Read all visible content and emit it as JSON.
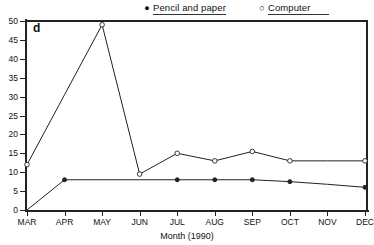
{
  "panel": {
    "label": "d"
  },
  "legend": {
    "position": "top",
    "items": [
      {
        "marker": "filled-dot-icon",
        "glyph": "●",
        "label": "Pencil and paper"
      },
      {
        "marker": "open-circle-icon",
        "glyph": "○",
        "label": "Computer"
      }
    ]
  },
  "chart_data": {
    "type": "line",
    "title": "",
    "subtitle": "",
    "panel_label": "d",
    "xlabel": "Month (1990)",
    "ylabel": "",
    "categories": [
      "MAR",
      "APR",
      "MAY",
      "JUN",
      "JUL",
      "AUG",
      "SEP",
      "OCT",
      "NOV",
      "DEC"
    ],
    "x": [
      "MAR",
      "APR",
      "MAY",
      "JUN",
      "JUL",
      "AUG",
      "SEP",
      "OCT",
      "NOV",
      "DEC"
    ],
    "ylim": [
      0,
      50
    ],
    "yticks": [
      0,
      5,
      10,
      15,
      20,
      25,
      30,
      35,
      40,
      45,
      50
    ],
    "grid": false,
    "legend_position": "top",
    "series": [
      {
        "name": "Pencil and paper",
        "marker": "filled-circle",
        "color": "#222222",
        "values": [
          0,
          8,
          8,
          8,
          8,
          8,
          8,
          7.5,
          6.8,
          6
        ],
        "marked_points": [
          "APR",
          "JUL",
          "AUG",
          "SEP",
          "OCT",
          "DEC"
        ]
      },
      {
        "name": "Computer",
        "marker": "open-circle",
        "color": "#222222",
        "values": [
          12,
          30.5,
          49,
          9.5,
          15,
          13,
          15.5,
          13,
          13,
          13
        ],
        "marked_points": [
          "MAR",
          "MAY",
          "JUN",
          "JUL",
          "AUG",
          "SEP",
          "OCT",
          "DEC"
        ]
      }
    ]
  },
  "axes": {
    "y_tick_labels": [
      "0",
      "5",
      "10",
      "15",
      "20",
      "25",
      "30",
      "35",
      "40",
      "45",
      "50"
    ],
    "x_tick_labels": [
      "MAR",
      "APR",
      "MAY",
      "JUN",
      "JUL",
      "AUG",
      "SEP",
      "OCT",
      "NOV",
      "DEC"
    ],
    "x_title": "Month (1990)"
  }
}
